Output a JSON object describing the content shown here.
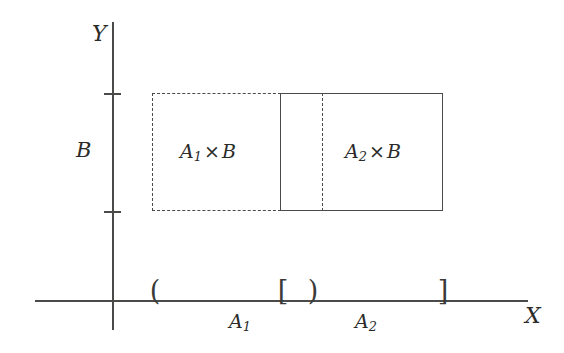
{
  "figure": {
    "type": "cartesian-product-diagram",
    "line_color": "#4a4a48",
    "text_color": "#2b2b29",
    "background": "#ffffff"
  },
  "axes": {
    "x": {
      "name": "X",
      "origin_x": 113,
      "start_x": 35,
      "end_x": 528,
      "y": 300
    },
    "y": {
      "name": "Y",
      "x": 113,
      "start_y": 22,
      "end_y": 330,
      "ticks": [
        {
          "name": "b-upper-tick",
          "y": 93
        },
        {
          "name": "b-lower-tick",
          "y": 211
        }
      ],
      "interval_label": "B"
    }
  },
  "regions": [
    {
      "name": "A1 x B",
      "label_base": "A",
      "label_sub": "1",
      "operator": "×",
      "label_factor": "B",
      "border_style": "dashed",
      "left": 152,
      "top": 93,
      "width": 129,
      "height": 118
    },
    {
      "name": "A2 x B",
      "label_base": "A",
      "label_sub": "2",
      "operator": "×",
      "label_factor": "B",
      "border_style": "solid",
      "left": 280,
      "top": 93,
      "width": 163,
      "height": 118
    }
  ],
  "divider": {
    "name": "interior-dashed-divider",
    "x": 322,
    "style": "dashed"
  },
  "x_intervals": [
    {
      "name": "A1",
      "label_base": "A",
      "label_sub": "1",
      "open_bracket": "(",
      "close_bracket": ")",
      "open_x": 155,
      "close_x": 313,
      "label_x": 240
    },
    {
      "name": "A2",
      "label_base": "A",
      "label_sub": "2",
      "open_bracket": "[",
      "close_bracket": "]",
      "open_x": 283,
      "close_x": 443,
      "label_x": 366
    }
  ],
  "brackets": [
    {
      "name": "a1-open-paren",
      "glyph": "(",
      "x": 155
    },
    {
      "name": "a2-open-bracket",
      "glyph": "[",
      "x": 283
    },
    {
      "name": "a1-close-paren",
      "glyph": ")",
      "x": 313
    },
    {
      "name": "a2-close-bracket",
      "glyph": "]",
      "x": 443
    }
  ]
}
